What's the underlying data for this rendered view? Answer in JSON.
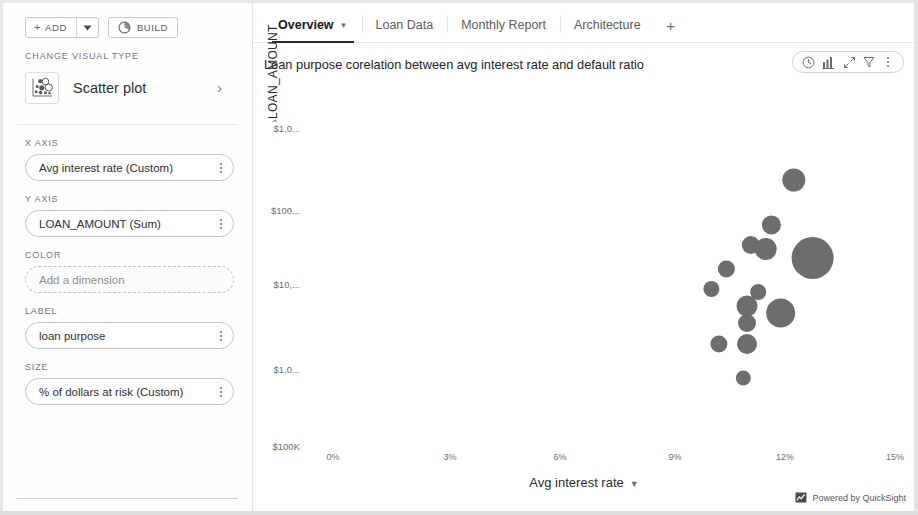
{
  "sidebar": {
    "toolbar": {
      "add_label": "ADD",
      "add_plus_icon": "plus-icon",
      "add_caret_icon": "caret-down-icon",
      "build_label": "BUILD",
      "build_icon": "build-pie-icon"
    },
    "visual_type": {
      "section_label": "CHANGE VISUAL TYPE",
      "name": "Scatter plot",
      "icon": "scatter-plot-icon",
      "chevron_icon": "chevron-right-icon"
    },
    "fields": [
      {
        "section_label": "X AXIS",
        "value": "Avg interest rate (Custom)",
        "placeholder": "",
        "empty": false,
        "menu_icon": "kebab-menu-icon"
      },
      {
        "section_label": "Y AXIS",
        "value": "LOAN_AMOUNT (Sum)",
        "placeholder": "",
        "empty": false,
        "menu_icon": "kebab-menu-icon"
      },
      {
        "section_label": "COLOR",
        "value": "",
        "placeholder": "Add a dimension",
        "empty": true,
        "menu_icon": ""
      },
      {
        "section_label": "LABEL",
        "value": "loan purpose",
        "placeholder": "",
        "empty": false,
        "menu_icon": "kebab-menu-icon"
      },
      {
        "section_label": "SIZE",
        "value": "% of dollars at risk (Custom)",
        "placeholder": "",
        "empty": false,
        "menu_icon": "kebab-menu-icon"
      }
    ]
  },
  "tabs": [
    {
      "label": "Overview",
      "active": true,
      "caret_icon": "caret-down-icon"
    },
    {
      "label": "Loan Data",
      "active": false,
      "caret_icon": ""
    },
    {
      "label": "Monthly Report",
      "active": false,
      "caret_icon": ""
    },
    {
      "label": "Architecture",
      "active": false,
      "caret_icon": ""
    }
  ],
  "tab_add_label": "+",
  "visual": {
    "title": "Loan purpose corelation between avg interest rate and default ratio",
    "actions": [
      {
        "name": "clock-icon",
        "glyph": "clock"
      },
      {
        "name": "chart-icon",
        "glyph": "chart"
      },
      {
        "name": "maximize-icon",
        "glyph": "maximize"
      },
      {
        "name": "filter-icon",
        "glyph": "filter"
      },
      {
        "name": "kebab-menu-icon",
        "glyph": "kebab"
      }
    ]
  },
  "footer": {
    "powered_by": "Powered by QuickSight",
    "icon": "quicksight-icon"
  },
  "colors": {
    "bubble": "#6d6d6d",
    "tab_active_underline": "#2b2b2b",
    "text_primary": "#232323",
    "text_muted": "#6e6e6e",
    "border": "#d3d3d3"
  },
  "chart_data": {
    "type": "scatter",
    "title": "Loan purpose corelation between avg interest rate and default ratio",
    "xlabel": "Avg interest rate",
    "ylabel": "LOAN_AMOUNT",
    "grid": false,
    "legend": null,
    "x_scale": "linear",
    "y_scale": "log",
    "xticks": [
      "0%",
      "3%",
      "6%",
      "9%",
      "12%",
      "15%"
    ],
    "xtick_values": [
      0,
      3,
      6,
      9,
      12,
      15
    ],
    "yticks": [
      "$1,0...",
      "$100...",
      "$10,...",
      "$1,0...",
      "$100K"
    ],
    "ytick_full": [
      "$1,000M",
      "$100M",
      "$10,M",
      "$1,0M",
      "$100K"
    ],
    "xlim": [
      0,
      15
    ],
    "size_field": "% of dollars at risk (Custom)",
    "label_field": "loan purpose",
    "points": [
      {
        "x": 12.3,
        "y_px": 177,
        "size": 11.5
      },
      {
        "x": 11.7,
        "y_px": 222,
        "size": 9.5
      },
      {
        "x": 11.15,
        "y_px": 242,
        "size": 9.0
      },
      {
        "x": 11.55,
        "y_px": 246,
        "size": 11.0
      },
      {
        "x": 12.8,
        "y_px": 255,
        "size": 21.0
      },
      {
        "x": 10.5,
        "y_px": 266,
        "size": 8.5
      },
      {
        "x": 10.1,
        "y_px": 286,
        "size": 8.0
      },
      {
        "x": 11.35,
        "y_px": 289,
        "size": 8.0
      },
      {
        "x": 11.05,
        "y_px": 303,
        "size": 10.5
      },
      {
        "x": 11.95,
        "y_px": 310,
        "size": 14.5
      },
      {
        "x": 11.05,
        "y_px": 320,
        "size": 9.0
      },
      {
        "x": 10.3,
        "y_px": 341,
        "size": 8.5
      },
      {
        "x": 11.05,
        "y_px": 341,
        "size": 10.0
      },
      {
        "x": 10.95,
        "y_px": 375,
        "size": 7.5
      }
    ]
  }
}
